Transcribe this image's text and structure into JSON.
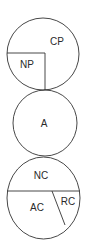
{
  "diagram": {
    "circles": [
      {
        "id": "top",
        "segments": [
          {
            "label": "CP"
          },
          {
            "label": "NP"
          }
        ]
      },
      {
        "id": "middle",
        "segments": [
          {
            "label": "A"
          }
        ]
      },
      {
        "id": "bottom",
        "segments": [
          {
            "label": "NC"
          },
          {
            "label": "AC"
          },
          {
            "label": "RC"
          }
        ]
      }
    ],
    "stroke_color": "#333333"
  }
}
